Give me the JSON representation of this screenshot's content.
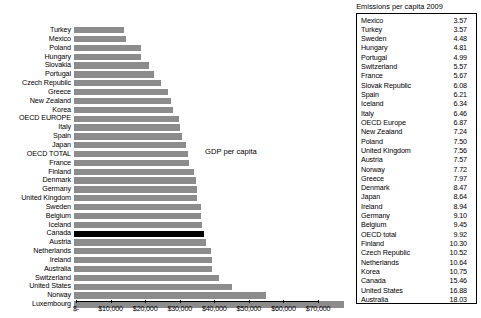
{
  "chart_data": {
    "type": "bar",
    "title": "",
    "annotation": "GDP per capita",
    "orientation": "horizontal",
    "xlabel": "",
    "ylabel": "",
    "xlim": [
      0,
      70000
    ],
    "grid": false,
    "axis_ticks": [
      "$-",
      "$10,000",
      "$20,000",
      "$30,000",
      "$40,000",
      "$50,000",
      "$60,000",
      "$70,000"
    ],
    "axis_tick_values": [
      0,
      10000,
      20000,
      30000,
      40000,
      50000,
      60000,
      70000
    ],
    "highlight_category": "Canada",
    "highlight_color": "#000000",
    "bar_color": "#8c8c8c",
    "categories": [
      "Turkey",
      "Mexico",
      "Poland",
      "Hungary",
      "Slovakia",
      "Portugal",
      "Czech Republic",
      "Greece",
      "New Zealand",
      "Korea",
      "OECD EUROPE",
      "Italy",
      "Spain",
      "Japan",
      "OECD TOTAL",
      "France",
      "Finland",
      "Denmark",
      "Germany",
      "United Kingdom",
      "Sweden",
      "Belgium",
      "Iceland",
      "Canada",
      "Austria",
      "Netherlands",
      "Ireland",
      "Australia",
      "Switzerland",
      "United States",
      "Norway",
      "Luxembourg"
    ],
    "values": [
      14600,
      15000,
      19300,
      19300,
      21700,
      23200,
      25100,
      27100,
      28100,
      28600,
      30300,
      30800,
      31100,
      32300,
      32900,
      33300,
      34800,
      35300,
      35600,
      35700,
      36600,
      36800,
      36900,
      37500,
      38300,
      39600,
      39800,
      40000,
      42000,
      45800,
      55500,
      78000
    ]
  },
  "legend": {
    "title": "Emissions per capita 2009",
    "rows": [
      {
        "name": "Mexico",
        "value": "3.57"
      },
      {
        "name": "Turkey",
        "value": "3.57"
      },
      {
        "name": "Sweden",
        "value": "4.48"
      },
      {
        "name": "Hungary",
        "value": "4.81"
      },
      {
        "name": "Portugal",
        "value": "4.99"
      },
      {
        "name": "Switzerland",
        "value": "5.57"
      },
      {
        "name": "France",
        "value": "5.67"
      },
      {
        "name": "Slovak Republic",
        "value": "6.08"
      },
      {
        "name": "Spain",
        "value": "6.21"
      },
      {
        "name": "Iceland",
        "value": "6.34"
      },
      {
        "name": "Italy",
        "value": "6.46"
      },
      {
        "name": "OECD Europe",
        "value": "6.87"
      },
      {
        "name": "New Zealand",
        "value": "7.24"
      },
      {
        "name": "Poland",
        "value": "7.50"
      },
      {
        "name": "United Kingdom",
        "value": "7.56"
      },
      {
        "name": "Austria",
        "value": "7.57"
      },
      {
        "name": "Norway",
        "value": "7.72"
      },
      {
        "name": "Greece",
        "value": "7.97"
      },
      {
        "name": "Denmark",
        "value": "8.47"
      },
      {
        "name": "Japan",
        "value": "8.64"
      },
      {
        "name": "Ireland",
        "value": "8.94"
      },
      {
        "name": "Germany",
        "value": "9.10"
      },
      {
        "name": "Belgium",
        "value": "9.45"
      },
      {
        "name": "OECD total",
        "value": "9.92"
      },
      {
        "name": "Finland",
        "value": "10.30"
      },
      {
        "name": "Czech Republic",
        "value": "10.52"
      },
      {
        "name": "Netherlands",
        "value": "10.64"
      },
      {
        "name": "Korea",
        "value": "10.75"
      },
      {
        "name": "Canada",
        "value": "15.46"
      },
      {
        "name": "United States",
        "value": "16.88"
      },
      {
        "name": "Australia",
        "value": "18.03"
      },
      {
        "name": "Luxembourg",
        "value": "20.07"
      }
    ]
  }
}
